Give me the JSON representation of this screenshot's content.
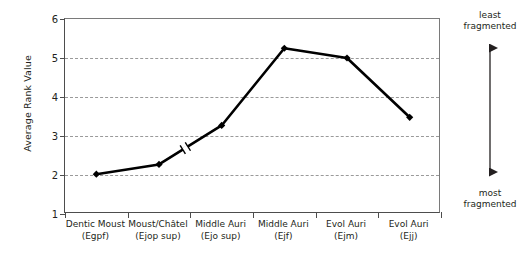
{
  "chart_data": {
    "type": "line",
    "title": "",
    "xlabel": "",
    "ylabel": "Average Rank Value",
    "ylim": [
      1,
      6
    ],
    "yticks": [
      1,
      2,
      3,
      4,
      5,
      6
    ],
    "gridlines": [
      2,
      3,
      4,
      5
    ],
    "grid": "horizontal-dashed",
    "legend": "none",
    "categories": [
      "Dentic Moust\n(Egpf)",
      "Moust/Châtel\n(Ejop sup)",
      "Middle Auri\n(Ejo sup)",
      "Middle Auri\n(Ejf)",
      "Evol Auri\n(Ejm)",
      "Evol Auri\n(Ejj)"
    ],
    "category_lines": [
      {
        "line1": "Dentic Moust",
        "line2": "(Egpf)"
      },
      {
        "line1": "Moust/Châtel",
        "line2": "(Ejop sup)"
      },
      {
        "line1": "Middle Auri",
        "line2": "(Ejo sup)"
      },
      {
        "line1": "Middle Auri",
        "line2": "(Ejf)"
      },
      {
        "line1": "Evol Auri",
        "line2": "(Ejm)"
      },
      {
        "line1": "Evol Auri",
        "line2": "(Ejj)"
      }
    ],
    "values": [
      2.02,
      2.27,
      3.27,
      5.25,
      5.0,
      3.48
    ],
    "series": [
      {
        "name": "Average Rank Value",
        "values": [
          2.02,
          2.27,
          3.27,
          5.25,
          5.0,
          3.48
        ],
        "marker": "diamond",
        "color": "#000000",
        "line_width": 2.6
      }
    ],
    "annotations": [
      {
        "name": "axis-break-mark",
        "between": [
          2,
          3
        ],
        "at_value": 2.82
      }
    ]
  },
  "axis": {
    "y_title": "Average Rank Value",
    "y_tick_labels": [
      "6",
      "5",
      "4",
      "3",
      "2",
      "1"
    ]
  },
  "side_annotation": {
    "top_label_line1": "least",
    "top_label_line2": "fragmented",
    "bottom_label_line1": "most",
    "bottom_label_line2": "fragmented",
    "arrow": "double-headed-vertical"
  },
  "colors": {
    "line": "#000000",
    "marker": "#000000",
    "grid": "#9a9a9a",
    "axis": "#4d4d4d",
    "frame": "#7a7a7a",
    "text": "#231f20",
    "background": "#ffffff"
  }
}
